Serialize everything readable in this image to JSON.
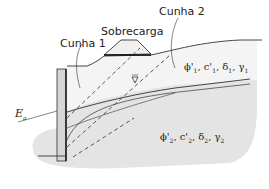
{
  "diagram": {
    "labels": {
      "surcharge": "Sobrecarga",
      "wedge1": "Cunha 1",
      "wedge2": "Cunha 2",
      "active_force": "E",
      "active_force_sub": "a",
      "water_table_symbol": "∇"
    },
    "layer1": {
      "phi": "ϕ'",
      "phi_sub": "1",
      "c": "c'",
      "c_sub": "1",
      "delta": "δ",
      "delta_sub": "1",
      "gamma": "γ",
      "gamma_sub": "1"
    },
    "layer2": {
      "phi": "ϕ'",
      "phi_sub": "2",
      "c": "c'",
      "c_sub": "2",
      "delta": "δ",
      "delta_sub": "2",
      "gamma": "γ",
      "gamma_sub": "2"
    },
    "colors": {
      "line": "#333333",
      "soil_lower": "#e3e3e3",
      "soil_upper": "#f1f1f1",
      "wall": "#d8d8d8"
    }
  }
}
